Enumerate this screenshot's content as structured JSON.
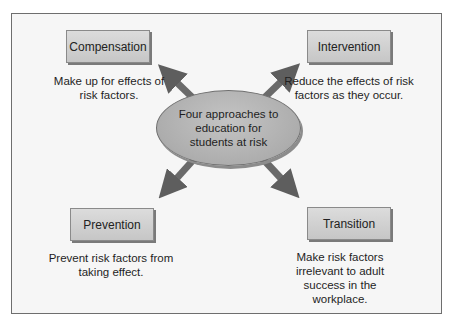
{
  "diagram": {
    "center": {
      "label": "Four approaches to education for students at risk"
    },
    "nodes": [
      {
        "id": "compensation",
        "title": "Compensation",
        "description": "Make up for effects of risk factors."
      },
      {
        "id": "intervention",
        "title": "Intervention",
        "description": "Reduce the effects of risk factors as they occur."
      },
      {
        "id": "prevention",
        "title": "Prevention",
        "description": "Prevent risk factors from taking effect."
      },
      {
        "id": "transition",
        "title": "Transition",
        "description": "Make risk factors irrelevant to adult success in the workplace."
      }
    ],
    "colors": {
      "box_fill": "#d0d0d0",
      "arrow": "#6a6a6a",
      "ellipse": "#b4b4b4",
      "frame": "#6e6e6e"
    }
  }
}
